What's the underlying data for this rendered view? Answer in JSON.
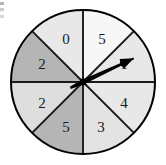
{
  "figure": {
    "kind": "spinner-wheel",
    "background_color": "#ffffff",
    "outline_color": "#000000",
    "divider_color": "#1a1a1a"
  },
  "wheel": {
    "center_x": 83,
    "center_y": 82,
    "radius": 72,
    "sector_count": 8,
    "sector_angle_degrees": 45,
    "sectors": [
      {
        "label": "5",
        "start_deg": -90,
        "end_deg": -45,
        "fill": "#f7f7f7",
        "label_x": 102,
        "label_y": 39
      },
      {
        "label": "1",
        "start_deg": -45,
        "end_deg": 0,
        "fill": "#e8e8e8",
        "label_x": 124,
        "label_y": 64
      },
      {
        "label": "4",
        "start_deg": 0,
        "end_deg": 45,
        "fill": "#e8e8e8",
        "label_x": 124,
        "label_y": 103
      },
      {
        "label": "3",
        "start_deg": 45,
        "end_deg": 90,
        "fill": "#e3e3e3",
        "label_x": 101,
        "label_y": 127
      },
      {
        "label": "5",
        "start_deg": 90,
        "end_deg": 135,
        "fill": "#b5b5b5",
        "label_x": 66,
        "label_y": 127
      },
      {
        "label": "2",
        "start_deg": 135,
        "end_deg": 180,
        "fill": "#dedede",
        "label_x": 42,
        "label_y": 103
      },
      {
        "label": "2",
        "start_deg": 180,
        "end_deg": 225,
        "fill": "#b5b5b5",
        "label_x": 42,
        "label_y": 64
      },
      {
        "label": "0",
        "start_deg": 225,
        "end_deg": 270,
        "fill": "#e8e8e8",
        "label_x": 66,
        "label_y": 39
      }
    ]
  },
  "pointer": {
    "name": "spinner-arrow",
    "color": "#000000",
    "points_to_label": "1",
    "angle_degrees": -25,
    "length": 56
  },
  "chart_data": {
    "type": "pie",
    "categories": [
      "5",
      "1",
      "4",
      "3",
      "5",
      "2",
      "2",
      "0"
    ],
    "values": [
      45,
      45,
      45,
      45,
      45,
      45,
      45,
      45
    ],
    "value_units": "degrees",
    "legend": "none",
    "grid": false,
    "annotations": [
      "arrow points to sector 1"
    ]
  }
}
